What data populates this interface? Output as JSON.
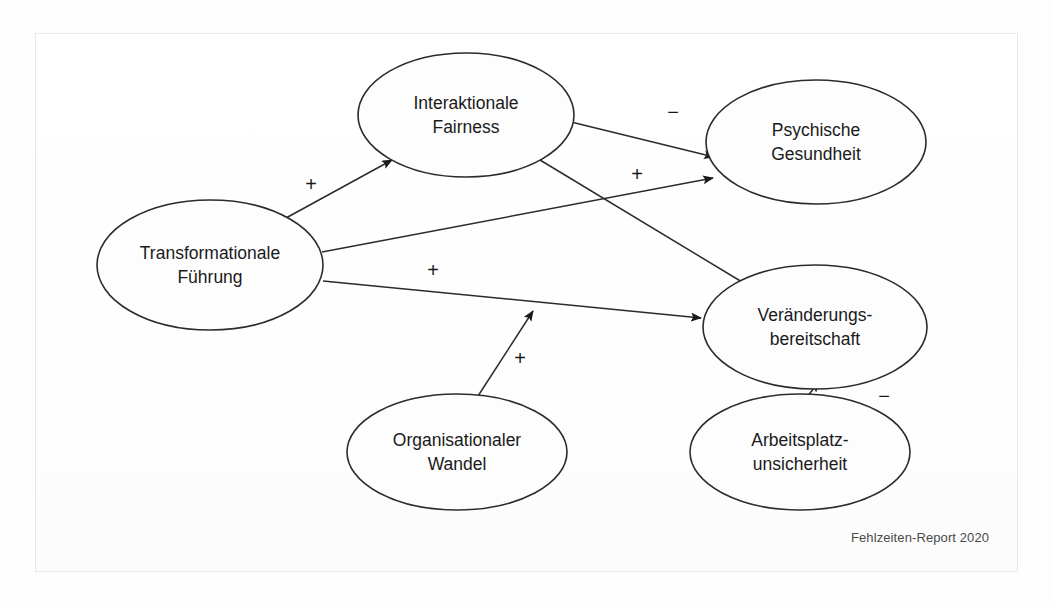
{
  "figure": {
    "caption": "Fehlzeiten-Report 2020",
    "frame_color": "#e8e8e8",
    "background_color": "#fdfdfd",
    "line_color": "#2b2b2b"
  },
  "nodes": [
    {
      "id": "interaktionale-fairness",
      "line1": "Interaktionale",
      "line2": "Fairness",
      "cx": 466,
      "cy": 115,
      "rx": 108,
      "ry": 62
    },
    {
      "id": "transformationale-fuehrung",
      "line1": "Transformationale",
      "line2": "Führung",
      "cx": 210,
      "cy": 265,
      "rx": 113,
      "ry": 65
    },
    {
      "id": "psychische-gesundheit",
      "line1": "Psychische",
      "line2": "Gesundheit",
      "cx": 816,
      "cy": 142,
      "rx": 110,
      "ry": 62
    },
    {
      "id": "veraenderungsbereitschaft",
      "line1": "Veränderungs-",
      "line2": "bereitschaft",
      "cx": 815,
      "cy": 327,
      "rx": 112,
      "ry": 62
    },
    {
      "id": "organisationaler-wandel",
      "line1": "Organisationaler",
      "line2": "Wandel",
      "cx": 457,
      "cy": 452,
      "rx": 110,
      "ry": 58
    },
    {
      "id": "arbeitsplatzunsicherheit",
      "line1": "Arbeitsplatz-",
      "line2": "unsicherheit",
      "cx": 800,
      "cy": 452,
      "rx": 110,
      "ry": 58
    }
  ],
  "edges": [
    {
      "id": "tf-to-if",
      "from": "transformationale-fuehrung",
      "to": "interaktionale-fairness",
      "sign": "+",
      "sign_x": 311,
      "sign_y": 186,
      "x1": 286,
      "y1": 218,
      "x2": 392,
      "y2": 160
    },
    {
      "id": "if-to-pg",
      "from": "interaktionale-fairness",
      "to": "psychische-gesundheit",
      "sign": "−",
      "sign_x": 673,
      "sign_y": 114,
      "x1": 567,
      "y1": 121,
      "x2": 714,
      "y2": 157
    },
    {
      "id": "tf-to-pg",
      "from": "transformationale-fuehrung",
      "to": "psychische-gesundheit",
      "sign": "+",
      "sign_x": 637,
      "sign_y": 176,
      "x1": 322,
      "y1": 252,
      "x2": 713,
      "y2": 178
    },
    {
      "id": "if-to-vb",
      "from": "interaktionale-fairness",
      "to": "veraenderungsbereitschaft",
      "sign": "",
      "sign_x": 0,
      "sign_y": 0,
      "x1": 540,
      "y1": 160,
      "x2": 752,
      "y2": 288
    },
    {
      "id": "tf-to-vb",
      "from": "transformationale-fuehrung",
      "to": "veraenderungsbereitschaft",
      "sign": "+",
      "sign_x": 433,
      "sign_y": 272,
      "x1": 323,
      "y1": 281,
      "x2": 701,
      "y2": 318
    },
    {
      "id": "ow-to-vb",
      "from": "organisationaler-wandel",
      "to": "veraenderungsbereitschaft",
      "sign": "+",
      "sign_x": 520,
      "sign_y": 360,
      "x1": 478,
      "y1": 396,
      "x2": 533,
      "y2": 311
    },
    {
      "id": "au-to-vb",
      "from": "arbeitsplatzunsicherheit",
      "to": "veraenderungsbereitschaft",
      "sign": "−",
      "sign_x": 884,
      "sign_y": 398,
      "x1": 806,
      "y1": 398,
      "x2": 819,
      "y2": 382
    }
  ],
  "chart_data": {
    "type": "diagram",
    "title": "",
    "nodes": [
      "Interaktionale Fairness",
      "Transformationale Führung",
      "Psychische Gesundheit",
      "Veränderungsbereitschaft",
      "Organisationaler Wandel",
      "Arbeitsplatzunsicherheit"
    ],
    "relations": [
      {
        "source": "Transformationale Führung",
        "target": "Interaktionale Fairness",
        "effect": "+"
      },
      {
        "source": "Interaktionale Fairness",
        "target": "Psychische Gesundheit",
        "effect": "−"
      },
      {
        "source": "Transformationale Führung",
        "target": "Psychische Gesundheit",
        "effect": "+"
      },
      {
        "source": "Interaktionale Fairness",
        "target": "Veränderungsbereitschaft",
        "effect": ""
      },
      {
        "source": "Transformationale Führung",
        "target": "Veränderungsbereitschaft",
        "effect": "+"
      },
      {
        "source": "Organisationaler Wandel",
        "target": "Veränderungsbereitschaft",
        "effect": "+"
      },
      {
        "source": "Arbeitsplatzunsicherheit",
        "target": "Veränderungsbereitschaft",
        "effect": "−"
      }
    ],
    "source": "Fehlzeiten-Report 2020"
  }
}
